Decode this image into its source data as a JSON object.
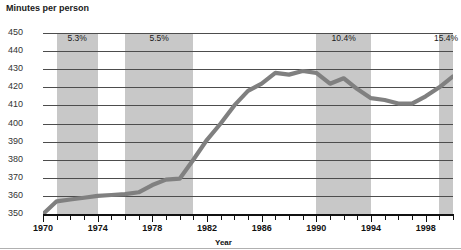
{
  "chart_data": {
    "type": "line",
    "title": "Minutes per person",
    "xlabel": "Year",
    "ylabel": "Minutes per person",
    "ylim": [
      350,
      450
    ],
    "xlim": [
      1970,
      2000
    ],
    "yticks": [
      450,
      440,
      430,
      420,
      410,
      400,
      390,
      380,
      370,
      360,
      350
    ],
    "xticks": [
      1970,
      1974,
      1978,
      1982,
      1986,
      1990,
      1994,
      1998
    ],
    "xtick_labels": [
      "1970",
      "1974",
      "1978",
      "1982",
      "1986",
      "1990",
      "1994",
      "1998"
    ],
    "ytick_labels": [
      "450",
      "440",
      "430",
      "420",
      "410",
      "400",
      "390",
      "380",
      "370",
      "360",
      "350"
    ],
    "grid": true,
    "legend": "none",
    "line_color": "#808080",
    "band_color": "#c8c8c8",
    "x": [
      1970,
      1971,
      1972,
      1973,
      1974,
      1975,
      1976,
      1977,
      1978,
      1979,
      1980,
      1981,
      1982,
      1983,
      1984,
      1985,
      1986,
      1987,
      1988,
      1989,
      1990,
      1991,
      1992,
      1993,
      1994,
      1995,
      1996,
      1997,
      1998,
      1999,
      2000
    ],
    "values": [
      350,
      357,
      358,
      359,
      360,
      360.5,
      361,
      362,
      366,
      369,
      369.5,
      380,
      391,
      400,
      410,
      418,
      422,
      428,
      427,
      429,
      428,
      422,
      425,
      419,
      414,
      413,
      411,
      411,
      415,
      420,
      426
    ],
    "series": [
      {
        "name": "Minutes per person",
        "values": [
          350,
          357,
          358,
          359,
          360,
          360.5,
          361,
          362,
          366,
          369,
          369.5,
          380,
          391,
          400,
          410,
          418,
          422,
          428,
          427,
          429,
          428,
          422,
          425,
          419,
          414,
          413,
          411,
          411,
          415,
          420,
          426
        ]
      }
    ],
    "shaded_bands": [
      {
        "label": "5.3%",
        "start": 1971,
        "end": 1974
      },
      {
        "label": "5.5%",
        "start": 1976,
        "end": 1981
      },
      {
        "label": "10.4%",
        "start": 1990,
        "end": 1994
      },
      {
        "label": "15.4%",
        "start": 1999,
        "end": 2000
      }
    ],
    "annotations": [
      {
        "text": "5.3%"
      },
      {
        "text": "5.5%"
      },
      {
        "text": "10.4%"
      },
      {
        "text": "15.4%"
      }
    ]
  }
}
